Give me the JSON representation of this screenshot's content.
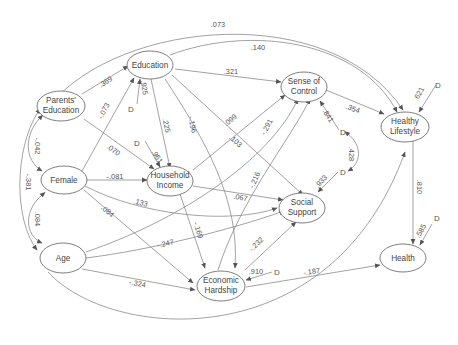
{
  "diagram": {
    "type": "path-model",
    "nodes": {
      "parents_education": {
        "line1": "Parents'",
        "line2": "Education"
      },
      "education": {
        "line1": "Education"
      },
      "female": {
        "line1": "Female"
      },
      "household_income": {
        "line1": "Household",
        "line2": "Income"
      },
      "age": {
        "line1": "Age"
      },
      "sense_of_control": {
        "line1": "Sense of",
        "line2": "Control"
      },
      "social_support": {
        "line1": "Social",
        "line2": "Support"
      },
      "economic_hardship": {
        "line1": "Economic",
        "line2": "Hardship"
      },
      "healthy_lifestyle": {
        "line1": "Healthy",
        "line2": "Lifestyle"
      },
      "health": {
        "line1": "Health"
      }
    },
    "disturbance_label": "D",
    "paths": {
      "pe_edu": ".369",
      "pe_hl": ".073",
      "pe_female": "-.042",
      "pe_age": "-.381",
      "female_age": ".084",
      "edu_hl": ".140",
      "edu_soc": ".321",
      "edu_hi": ".225",
      "edu_eh": "-.196",
      "edu_ss": ".103",
      "d_edu": ".925",
      "female_edu": "-.073",
      "female_hi": "-.081",
      "pe_hi": ".070",
      "d_hi": ".961",
      "female_ss": ".133",
      "female_eh": ".084",
      "hi_soc": ".099",
      "hi_ss": ".067",
      "hi_eh": "-.169",
      "age_soc": "-.291",
      "age_ss": "-.247",
      "age_eh": "-.324",
      "age_health": "-.502",
      "eh_soc": "-.216",
      "eh_ss": "-.232",
      "d_eh": ".910",
      "eh_health": "-.187",
      "soc_hl": ".354",
      "d_soc": ".841",
      "d_ss": ".933",
      "d_soc_ss_cov": ".428",
      "d_hl": ".621",
      "hl_health": ".810",
      "d_health": ".585"
    }
  }
}
